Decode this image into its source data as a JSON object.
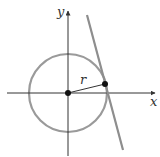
{
  "diagram": {
    "labels": {
      "x_axis": "x",
      "y_axis": "y",
      "radius": "r"
    },
    "colors": {
      "axes": "#333333",
      "circle": "#9a9a9a",
      "tangent_line": "#8e8e8e",
      "points": "#111111",
      "radius_segment": "#333333"
    },
    "geometry": {
      "origin": [
        68,
        93
      ],
      "circle_radius": 39,
      "tangent_point": [
        105,
        84
      ],
      "tangent_line": {
        "start": [
          87,
          15
        ],
        "end": [
          123,
          150
        ]
      }
    }
  }
}
